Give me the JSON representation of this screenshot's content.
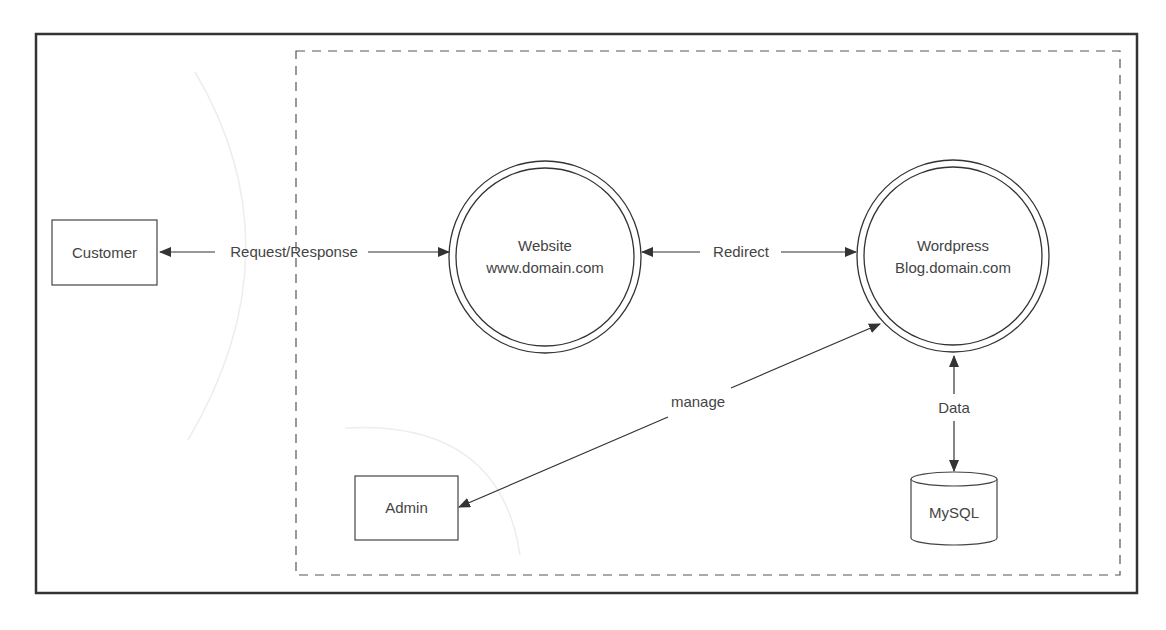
{
  "diagram": {
    "type": "data-flow",
    "nodes": [
      {
        "id": "customer",
        "shape": "rectangle",
        "label": "Customer"
      },
      {
        "id": "website",
        "shape": "double-circle",
        "title": "Website",
        "subtitle": "www.domain.com"
      },
      {
        "id": "wordpress",
        "shape": "double-circle",
        "title": "Wordpress",
        "subtitle": "Blog.domain.com"
      },
      {
        "id": "admin",
        "shape": "rectangle",
        "label": "Admin"
      },
      {
        "id": "mysql",
        "shape": "cylinder",
        "label": "MySQL"
      }
    ],
    "edges": [
      {
        "from": "website",
        "to": "customer",
        "label": "Request/Response",
        "direction": "both"
      },
      {
        "from": "website",
        "to": "wordpress",
        "label": "Redirect",
        "direction": "both"
      },
      {
        "from": "admin",
        "to": "wordpress",
        "label": "manage",
        "direction": "both"
      },
      {
        "from": "wordpress",
        "to": "mysql",
        "label": "Data",
        "direction": "both"
      }
    ],
    "boundary": {
      "style": "dashed",
      "contains": [
        "website",
        "wordpress",
        "admin",
        "mysql"
      ]
    },
    "colors": {
      "stroke": "#333333",
      "text": "#444444",
      "dashed": "#555555",
      "faint": "#ececec"
    }
  }
}
